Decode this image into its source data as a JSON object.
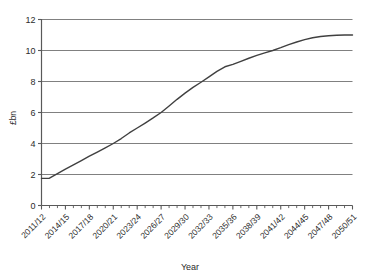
{
  "chart_data": {
    "type": "line",
    "title": "",
    "xlabel": "Year",
    "ylabel": "£bn",
    "ylim": [
      0,
      12
    ],
    "ytick_values": [
      0,
      2,
      4,
      6,
      8,
      10,
      12
    ],
    "ytick_labels": [
      "0",
      "2",
      "4",
      "6",
      "8",
      "10",
      "12"
    ],
    "grid": "horizontal",
    "legend": "none",
    "categories": [
      "2011/12",
      "2012/13",
      "2013/14",
      "2014/15",
      "2015/16",
      "2016/17",
      "2017/18",
      "2018/19",
      "2019/20",
      "2020/21",
      "2021/22",
      "2022/23",
      "2023/24",
      "2024/25",
      "2025/26",
      "2026/27",
      "2027/28",
      "2028/29",
      "2029/30",
      "2030/31",
      "2031/32",
      "2032/33",
      "2033/34",
      "2034/35",
      "2035/36",
      "2036/37",
      "2037/38",
      "2038/39",
      "2039/40",
      "2040/41",
      "2041/42",
      "2042/43",
      "2043/44",
      "2044/45",
      "2045/46",
      "2046/47",
      "2047/48",
      "2048/49",
      "2049/50",
      "2050/51"
    ],
    "xtick_labels_shown": [
      "2011/12",
      "2014/15",
      "2017/18",
      "2020/21",
      "2023/24",
      "2026/27",
      "2029/30",
      "2032/33",
      "2035/36",
      "2038/39",
      "2041/42",
      "2044/45",
      "2047/48",
      "2050/51"
    ],
    "xtick_label_interval": 3,
    "values": [
      1.75,
      1.76,
      2.05,
      2.35,
      2.62,
      2.9,
      3.18,
      3.45,
      3.72,
      4.0,
      4.32,
      4.68,
      5.0,
      5.32,
      5.65,
      6.0,
      6.42,
      6.85,
      7.25,
      7.62,
      7.95,
      8.3,
      8.65,
      8.95,
      9.1,
      9.3,
      9.5,
      9.68,
      9.85,
      10.0,
      10.18,
      10.38,
      10.55,
      10.7,
      10.82,
      10.9,
      10.95,
      10.98,
      11.0,
      11.0
    ],
    "series_color": "#404040",
    "gridline_color": "#808080",
    "axis_color": "#595959"
  }
}
